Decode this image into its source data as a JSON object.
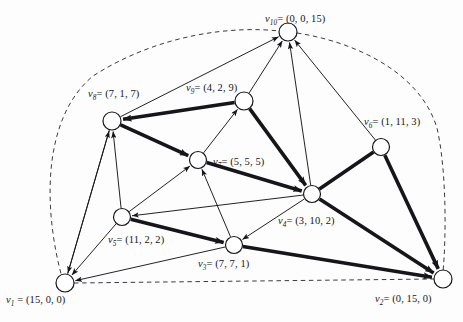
{
  "figure": {
    "type": "directed-graph-diagram",
    "background_color": "#fdfdfd",
    "ink_color": "#16161a"
  },
  "nodes": [
    {
      "id": "v1",
      "name": "v",
      "sub": "1",
      "sep": " = ",
      "coords": "(15, 0, 0)",
      "label": "v1 = (15, 0, 0)",
      "cx": 65,
      "cy": 283,
      "r": 9,
      "label_x": 6,
      "label_y": 294,
      "label_anchor": "left"
    },
    {
      "id": "v2",
      "name": "v",
      "sub": "2",
      "sep": "= ",
      "coords": "(0, 15, 0)",
      "label": "v2= (0, 15, 0)",
      "cx": 443,
      "cy": 279,
      "r": 9,
      "label_x": 375,
      "label_y": 293,
      "label_anchor": "left"
    },
    {
      "id": "v3",
      "name": "v",
      "sub": "3",
      "sep": "= ",
      "coords": "(7, 7, 1)",
      "label": "v3= (7, 7, 1)",
      "cx": 234,
      "cy": 245,
      "r": 8.5,
      "label_x": 198,
      "label_y": 258,
      "label_anchor": "left"
    },
    {
      "id": "v4",
      "name": "v",
      "sub": "4",
      "sep": "= ",
      "coords": "(3, 10, 2)",
      "label": "v4= (3, 10, 2)",
      "cx": 312,
      "cy": 194,
      "r": 8.5,
      "label_x": 278,
      "label_y": 215,
      "label_anchor": "left"
    },
    {
      "id": "v5",
      "name": "v",
      "sub": "5",
      "sep": "= ",
      "coords": "(11, 2, 2)",
      "label": "v5= (11, 2, 2)",
      "cx": 122,
      "cy": 217,
      "r": 8.5,
      "label_x": 108,
      "label_y": 234,
      "label_anchor": "left"
    },
    {
      "id": "v6",
      "name": "v",
      "sub": "6",
      "sep": "= ",
      "coords": "(1, 11, 3)",
      "label": "v6= (1, 11, 3)",
      "cx": 381,
      "cy": 147,
      "r": 8.5,
      "label_x": 364,
      "label_y": 116,
      "label_anchor": "left"
    },
    {
      "id": "v7",
      "name": "v",
      "sub": "7",
      "sep": "= ",
      "coords": "(5, 5, 5)",
      "label": "v7= (5, 5, 5)",
      "cx": 198,
      "cy": 160,
      "r": 8.5,
      "label_x": 213,
      "label_y": 156,
      "label_anchor": "left"
    },
    {
      "id": "v8",
      "name": "v",
      "sub": "8",
      "sep": "= ",
      "coords": "(7, 1, 7)",
      "label": "v8= (7, 1, 7)",
      "cx": 112,
      "cy": 121,
      "r": 9,
      "label_x": 88,
      "label_y": 88,
      "label_anchor": "left"
    },
    {
      "id": "v9",
      "name": "v",
      "sub": "9",
      "sep": "= ",
      "coords": "(4, 2, 9)",
      "label": "v9= (4, 2, 9)",
      "cx": 244,
      "cy": 101,
      "r": 9,
      "label_x": 186,
      "label_y": 82,
      "label_anchor": "left"
    },
    {
      "id": "v10",
      "name": "v",
      "sub": "10",
      "sep": "= ",
      "coords": "(0, 0, 15)",
      "label": "v10= (0, 0, 15)",
      "cx": 288,
      "cy": 32,
      "r": 9,
      "label_x": 265,
      "label_y": 13,
      "label_anchor": "left"
    }
  ],
  "edges": [
    {
      "from": "v9",
      "to": "v8",
      "weight": "thick",
      "arrow": true
    },
    {
      "from": "v8",
      "to": "v7",
      "weight": "thick",
      "arrow": true
    },
    {
      "from": "v9",
      "to": "v4",
      "weight": "thick",
      "arrow": true
    },
    {
      "from": "v7",
      "to": "v4",
      "weight": "thick",
      "arrow": true
    },
    {
      "from": "v5",
      "to": "v3",
      "weight": "thick",
      "arrow": true
    },
    {
      "from": "v3",
      "to": "v2",
      "weight": "thick",
      "arrow": true
    },
    {
      "from": "v4",
      "to": "v2",
      "weight": "thick",
      "arrow": true
    },
    {
      "from": "v6",
      "to": "v2",
      "weight": "thick",
      "arrow": true
    },
    {
      "from": "v1",
      "to": "v8",
      "weight": "thin",
      "arrow": true
    },
    {
      "from": "v5",
      "to": "v8",
      "weight": "thin",
      "arrow": true
    },
    {
      "from": "v8",
      "to": "v1",
      "weight": "thin",
      "arrow": true
    },
    {
      "from": "v5",
      "to": "v1",
      "weight": "thin",
      "arrow": true
    },
    {
      "from": "v3",
      "to": "v1",
      "weight": "thin",
      "arrow": true
    },
    {
      "from": "v3",
      "to": "v7",
      "weight": "thin",
      "arrow": true
    },
    {
      "from": "v5",
      "to": "v7",
      "weight": "thin",
      "arrow": true
    },
    {
      "from": "v7",
      "to": "v9",
      "weight": "thin",
      "arrow": true
    },
    {
      "from": "v4",
      "to": "v5",
      "weight": "thin",
      "arrow": true
    },
    {
      "from": "v4",
      "to": "v3",
      "weight": "thin",
      "arrow": true
    },
    {
      "from": "v4",
      "to": "v6",
      "weight": "thick",
      "arrow": false
    },
    {
      "from": "v8",
      "to": "v10",
      "weight": "thin",
      "arrow": true
    },
    {
      "from": "v9",
      "to": "v10",
      "weight": "thin",
      "arrow": true
    },
    {
      "from": "v4",
      "to": "v10",
      "weight": "thin",
      "arrow": true
    },
    {
      "from": "v6",
      "to": "v10",
      "weight": "thin",
      "arrow": true
    }
  ],
  "boundary": {
    "style": "dashed",
    "description": "dashed hull through v1, v10, v2 and along the bottom"
  }
}
